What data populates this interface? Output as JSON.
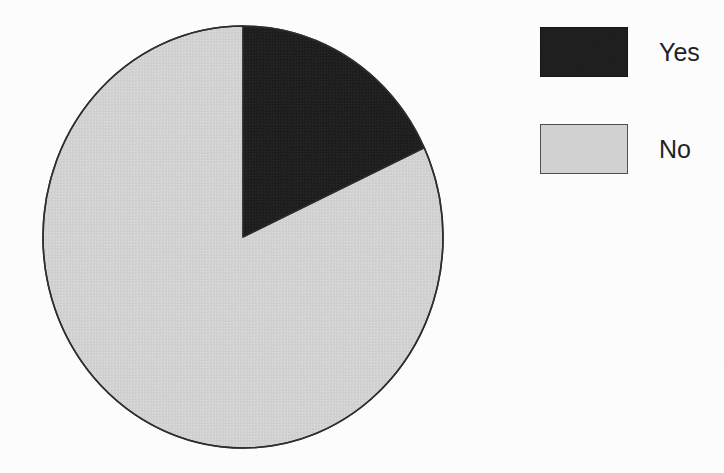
{
  "figure": {
    "background_color": "#fefefe",
    "type": "pie-chart-figure"
  },
  "chart_data": {
    "type": "pie",
    "title": "",
    "subtitle": "",
    "xlabel": "",
    "ylabel": "",
    "categories": [
      "Yes",
      "No"
    ],
    "values": [
      18,
      82
    ],
    "units": "percent",
    "slices": [
      {
        "label": "Yes",
        "value": 18,
        "color": "#1b1b1b",
        "start_angle_deg": 0,
        "end_angle_deg": 65,
        "sweep_deg": 65
      },
      {
        "label": "No",
        "value": 82,
        "color": "#d2d2d2",
        "start_angle_deg": 65,
        "end_angle_deg": 360,
        "sweep_deg": 295
      }
    ],
    "start_angle_deg": 0,
    "direction": "clockwise",
    "outline_color": "#2b2b2b",
    "legend_position": "right",
    "legend_entries": [
      "Yes",
      "No"
    ],
    "data_labels": false,
    "grid": false
  },
  "pie": {
    "center_x": 210,
    "center_y": 222,
    "radius_x": 200,
    "radius_y": 211,
    "outline_color": "#2b2b2b",
    "outline_width": 1.5
  },
  "legend": {
    "entries": [
      {
        "label": "Yes",
        "swatch_color": "#1b1b1b",
        "swatch_style": "sw-black"
      },
      {
        "label": "No",
        "swatch_color": "#d2d2d2",
        "swatch_style": "sw-gray"
      }
    ]
  },
  "colors": {
    "yes": "#1b1b1b",
    "no": "#d2d2d2",
    "outline": "#2b2b2b",
    "text": "#1c1c1c",
    "background": "#fefefe"
  }
}
